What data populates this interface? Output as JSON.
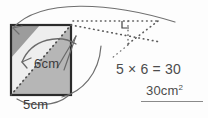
{
  "document": {
    "type": "geometry-worksheet-figure",
    "topic": "area-of-parallelogram"
  },
  "figure": {
    "shape_name": "parallelogram-square-decomposition",
    "height_label": "6cm",
    "base_label": "5cm",
    "right_angle_marker": "right-angle-icon",
    "arrows": [
      {
        "name": "transform-arrow-upper",
        "style": "curved"
      },
      {
        "name": "transform-arrow-lower",
        "style": "curved"
      },
      {
        "name": "base-arc",
        "style": "curved"
      }
    ],
    "colors": {
      "outline": "#2b2b2b",
      "shade_dark": "#9a9a9a",
      "shade_light": "#e8e8e8",
      "shade_mid": "#b9b9b9",
      "dotted": "#5a5a5a",
      "text": "#4a4a4a"
    }
  },
  "work": {
    "equation": "5 × 6 = 30",
    "answer_value": "30cm",
    "answer_exponent": "2",
    "answer_full": "30cm²",
    "underlined": true
  }
}
